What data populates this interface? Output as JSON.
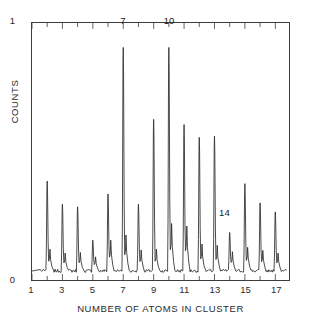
{
  "figure": {
    "background_color": "#ffffff",
    "trace_color": "#2a2a2a",
    "frame_color": "#3c3c3c"
  },
  "axes": {
    "x_title": "NUMBER OF ATOMS IN CLUSTER",
    "y_title": "COUNTS",
    "y_tick_top": "1",
    "y_tick_bottom": "0",
    "x_tick_labels": [
      "1",
      "3",
      "5",
      "7",
      "9",
      "11",
      "13",
      "15",
      "17"
    ]
  },
  "annotations": [
    {
      "text": "7",
      "x": 7,
      "y": 0.985
    },
    {
      "text": "10",
      "x": 10,
      "y": 0.985
    },
    {
      "text": "14",
      "x": 13.62,
      "y": 0.245
    }
  ],
  "chart_data": {
    "type": "line",
    "title": "",
    "subtitle": "",
    "xlabel": "NUMBER OF ATOMS IN CLUSTER",
    "ylabel": "COUNTS",
    "xlim": [
      1,
      17.9
    ],
    "ylim": [
      0,
      1
    ],
    "xticks": [
      1,
      3,
      5,
      7,
      9,
      11,
      13,
      15,
      17
    ],
    "xticks_minor": [
      2,
      4,
      6,
      8,
      10,
      12,
      14,
      16
    ],
    "yticks": [
      0,
      1
    ],
    "grid": false,
    "legend": null,
    "baseline": 0.035,
    "series": [
      {
        "name": "cluster ion signal",
        "peak_x": [
          2,
          3,
          4,
          5,
          6,
          7,
          8,
          9,
          10,
          11,
          12,
          13,
          14,
          15,
          16,
          17
        ],
        "peak_heights": [
          0.385,
          0.295,
          0.285,
          0.155,
          0.335,
          0.905,
          0.295,
          0.625,
          0.905,
          0.605,
          0.555,
          0.56,
          0.185,
          0.375,
          0.3,
          0.265
        ],
        "shoulder_x": [
          2.18,
          3.18,
          4.18,
          5.18,
          6.18,
          7.18,
          8.18,
          9.18,
          10.18,
          11.18,
          12.18,
          13.18,
          14.18,
          15.18,
          16.18,
          17.18
        ],
        "shoulder_heights": [
          0.085,
          0.07,
          0.072,
          0.055,
          0.12,
          0.14,
          0.082,
          0.085,
          0.185,
          0.175,
          0.105,
          0.1,
          0.075,
          0.092,
          0.08,
          0.07
        ]
      }
    ]
  }
}
